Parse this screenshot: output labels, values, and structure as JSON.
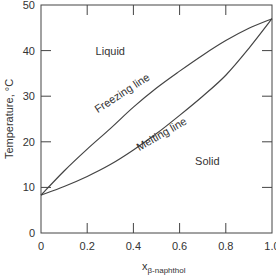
{
  "chart_data": {
    "type": "line",
    "title": "",
    "xlabel_main": "x",
    "xlabel_sub": "β-naphthol",
    "ylabel": "Temperature, °C",
    "xlim": [
      0,
      1.0
    ],
    "ylim": [
      0,
      50
    ],
    "grid": false,
    "x_ticks": [
      "0",
      "0.2",
      "0.4",
      "0.6",
      "0.8",
      "1.0"
    ],
    "x_tick_values": [
      0,
      0.2,
      0.4,
      0.6,
      0.8,
      1.0
    ],
    "y_ticks": [
      "0",
      "10",
      "20",
      "30",
      "40",
      "50"
    ],
    "y_tick_values": [
      0,
      10,
      20,
      30,
      40,
      50
    ],
    "series": [
      {
        "name": "Freezing line",
        "x": [
          0,
          0.1,
          0.2,
          0.3,
          0.4,
          0.5,
          0.6,
          0.7,
          0.8,
          0.9,
          1.0
        ],
        "y": [
          8.3,
          13.6,
          18.4,
          22.9,
          27.6,
          31.8,
          35.5,
          39.0,
          42.2,
          44.9,
          47.0
        ]
      },
      {
        "name": "Melting line",
        "x": [
          0,
          0.1,
          0.2,
          0.3,
          0.4,
          0.5,
          0.6,
          0.7,
          0.8,
          0.9,
          1.0
        ],
        "y": [
          8.3,
          10.2,
          12.4,
          15.0,
          18.2,
          21.8,
          25.8,
          30.0,
          34.6,
          40.5,
          47.0
        ]
      }
    ],
    "annotations": [
      {
        "text": "Liquid",
        "x": 0.3,
        "y": 39
      },
      {
        "text": "Solid",
        "x": 0.72,
        "y": 15
      },
      {
        "text": "Freezing line",
        "x": 0.36,
        "y": 30,
        "angle": -33
      },
      {
        "text": "Melting line",
        "x": 0.53,
        "y": 21,
        "angle": -30
      }
    ]
  }
}
